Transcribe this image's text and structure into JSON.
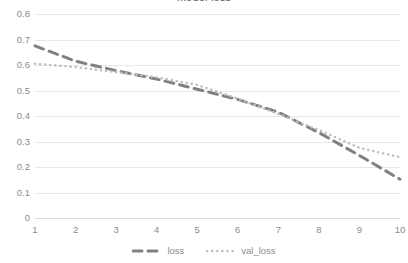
{
  "chart_data": {
    "type": "line",
    "title": "model loss",
    "xlabel": "",
    "ylabel": "",
    "x": [
      1,
      2,
      3,
      4,
      5,
      6,
      7,
      8,
      9,
      10
    ],
    "xtick_labels": [
      "1",
      "2",
      "3",
      "4",
      "5",
      "6",
      "7",
      "8",
      "9",
      "10"
    ],
    "ytick_labels": [
      "0.8",
      "0.7",
      "0.6",
      "0.5",
      "0.4",
      "0.3",
      "0.2",
      "0.1",
      "0"
    ],
    "ytick_values": [
      0.8,
      0.7,
      0.6,
      0.5,
      0.4,
      0.3,
      0.2,
      0.1,
      0
    ],
    "ylim": [
      0,
      0.8
    ],
    "xlim": [
      1,
      10
    ],
    "grid": true,
    "legend_position": "bottom",
    "series": [
      {
        "name": "loss",
        "style": "dashed",
        "color": "#808080",
        "values": [
          0.675,
          0.615,
          0.578,
          0.545,
          0.505,
          0.465,
          0.415,
          0.335,
          0.245,
          0.152
        ]
      },
      {
        "name": "val_loss",
        "style": "dotted",
        "color": "#bfbfbf",
        "values": [
          0.605,
          0.592,
          0.572,
          0.552,
          0.522,
          0.468,
          0.408,
          0.345,
          0.275,
          0.238
        ]
      }
    ]
  },
  "legend": {
    "entries": [
      {
        "label": "loss"
      },
      {
        "label": "val_loss"
      }
    ]
  },
  "colors": {
    "loss": "#808080",
    "val_loss": "#bfbfbf",
    "gridline": "#e8e8e8",
    "tick_text": "#8c8c8c",
    "background": "#ffffff"
  }
}
